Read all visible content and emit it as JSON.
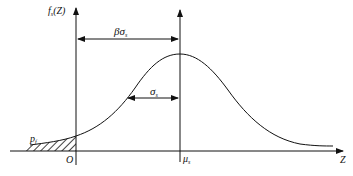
{
  "diagram": {
    "type": "normal-distribution-reliability",
    "y_axis_label": "f",
    "y_axis_label_sub": "s",
    "y_axis_label_arg": "(Z)",
    "x_axis_label": "Z",
    "origin_label": "O",
    "mean_label": "μ",
    "mean_label_sub": "s",
    "beta_sigma_label": "βσ",
    "beta_sigma_label_sub": "s",
    "sigma_label": "σ",
    "sigma_label_sub": "s",
    "failure_prob_label": "p",
    "failure_prob_label_sub": "f"
  },
  "colors": {
    "line": "#111111",
    "background": "#ffffff"
  }
}
